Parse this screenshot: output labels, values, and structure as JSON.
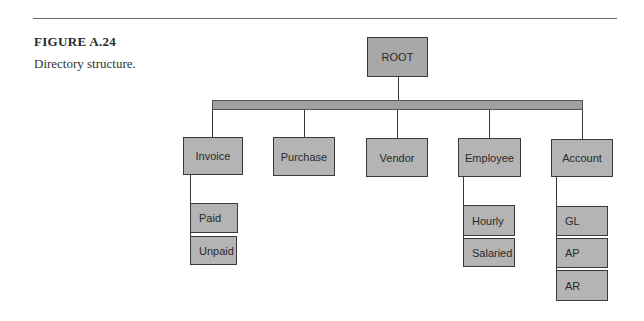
{
  "figure": {
    "label": "FIGURE A.24",
    "caption": "Directory structure."
  },
  "tree": {
    "root": "ROOT",
    "children": [
      {
        "label": "Invoice",
        "children": [
          "Paid",
          "Unpaid"
        ]
      },
      {
        "label": "Purchase",
        "children": []
      },
      {
        "label": "Vendor",
        "children": []
      },
      {
        "label": "Employee",
        "children": [
          "Hourly",
          "Salaried"
        ]
      },
      {
        "label": "Account",
        "children": [
          "GL",
          "AP",
          "AR"
        ]
      }
    ]
  },
  "colors": {
    "node_fill": "#b4b4b4",
    "bar_fill": "#a0a0a0",
    "line": "#3a3a3a"
  }
}
